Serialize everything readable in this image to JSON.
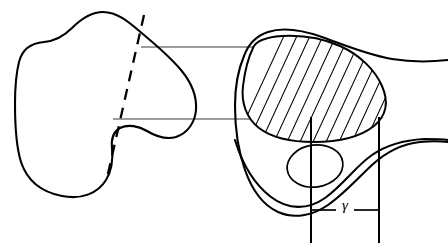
{
  "figure": {
    "background_color": "#ffffff",
    "line_color": "#000000",
    "projection_line_color": "#3a3a3a",
    "width": 448,
    "height": 246
  },
  "left_view": {
    "name": "left-outline-view",
    "description": "Closed irregular bone-like outline profile",
    "cut_plane": {
      "label": "",
      "style": "dashed",
      "from": [
        143,
        16
      ],
      "to": [
        108,
        176
      ]
    }
  },
  "right_view": {
    "name": "right-section-view",
    "description": "Side profile with hatched section region and small ellipse",
    "hatched_region": {
      "label": "",
      "hatch_angle_deg": 60,
      "hatch_spacing_px": 13
    },
    "small_ellipse": {
      "label": "",
      "cx": 315,
      "cy": 166,
      "rx": 27,
      "ry": 21
    }
  },
  "projection_lines": [
    {
      "name": "upper-projection-line",
      "y": 47,
      "x1": 141,
      "x2": 268
    },
    {
      "name": "lower-projection-line",
      "y": 119,
      "x1": 116,
      "x2": 258
    }
  ],
  "dimension": {
    "name": "gamma-dimension",
    "symbol": "γ",
    "label_x": 345,
    "label_y": 208,
    "line_y": 210,
    "left_ext_x": 311,
    "right_ext_x": 379,
    "ext_top_y": 117,
    "ext_bottom_y": 243
  }
}
